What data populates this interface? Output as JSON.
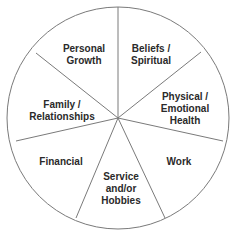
{
  "diagram": {
    "type": "wheel-of-life",
    "center": [
      118,
      118
    ],
    "radius": 111,
    "stroke_color": "#7a7a7a",
    "text_color": "#2a2a2a",
    "segments": [
      {
        "label": "Personal\nGrowth",
        "x": 84,
        "y": 55
      },
      {
        "label": "Beliefs /\nSpiritual",
        "x": 151,
        "y": 55
      },
      {
        "label": "Physical /\nEmotional\nHealth",
        "x": 185,
        "y": 109
      },
      {
        "label": "Work",
        "x": 179,
        "y": 162
      },
      {
        "label": "Service\nand/or\nHobbies",
        "x": 121,
        "y": 189
      },
      {
        "label": "Financial",
        "x": 61,
        "y": 162
      },
      {
        "label": "Family /\nRelationships",
        "x": 62,
        "y": 111
      }
    ]
  }
}
